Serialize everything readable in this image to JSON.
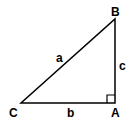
{
  "diagram": {
    "type": "right-triangle",
    "vertices": {
      "A": {
        "label": "A",
        "x": 115,
        "y": 103,
        "right_angle": true
      },
      "B": {
        "label": "B",
        "x": 115,
        "y": 19
      },
      "C": {
        "label": "C",
        "x": 21,
        "y": 103
      }
    },
    "sides": {
      "a": {
        "label": "a",
        "from": "B",
        "to": "C"
      },
      "b": {
        "label": "b",
        "from": "C",
        "to": "A"
      },
      "c": {
        "label": "c",
        "from": "A",
        "to": "B"
      }
    },
    "colors": {
      "stroke": "#000000",
      "background": "#ffffff"
    }
  }
}
